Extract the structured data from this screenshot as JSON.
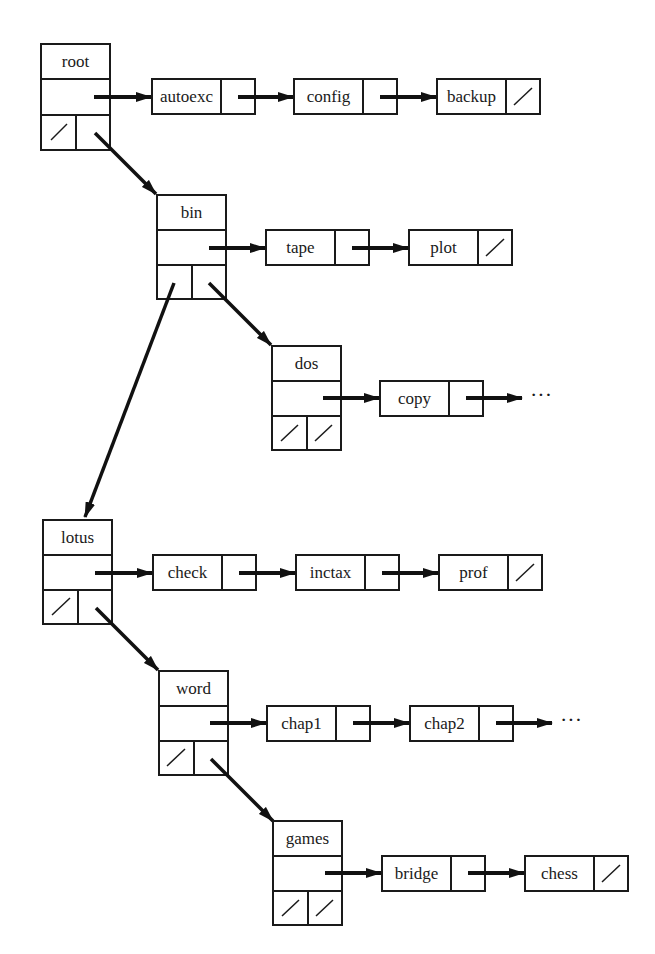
{
  "diagram": {
    "type": "directory-tree-linked-list",
    "colors": {
      "ink": "#1a1a1a",
      "background": "#ffffff"
    },
    "directories": [
      {
        "id": "root",
        "label": "root",
        "files": [
          "autoexc",
          "config",
          "backup"
        ],
        "files_continue": false,
        "left_child": null,
        "right_child": "bin"
      },
      {
        "id": "bin",
        "label": "bin",
        "files": [
          "tape",
          "plot"
        ],
        "files_continue": false,
        "left_child": "lotus",
        "right_child": "dos"
      },
      {
        "id": "dos",
        "label": "dos",
        "files": [
          "copy"
        ],
        "files_continue": true,
        "left_child": null,
        "right_child": null
      },
      {
        "id": "lotus",
        "label": "lotus",
        "files": [
          "check",
          "inctax",
          "prof"
        ],
        "files_continue": false,
        "left_child": null,
        "right_child": "word"
      },
      {
        "id": "word",
        "label": "word",
        "files": [
          "chap1",
          "chap2"
        ],
        "files_continue": true,
        "left_child": null,
        "right_child": "games"
      },
      {
        "id": "games",
        "label": "games",
        "files": [
          "bridge",
          "chess"
        ],
        "files_continue": false,
        "left_child": null,
        "right_child": null
      }
    ],
    "ellipsis": "···"
  },
  "labels": {
    "root": "root",
    "autoexc": "autoexc",
    "config": "config",
    "backup": "backup",
    "bin": "bin",
    "tape": "tape",
    "plot": "plot",
    "dos": "dos",
    "copy": "copy",
    "lotus": "lotus",
    "check": "check",
    "inctax": "inctax",
    "prof": "prof",
    "word": "word",
    "chap1": "chap1",
    "chap2": "chap2",
    "games": "games",
    "bridge": "bridge",
    "chess": "chess",
    "ellipsis": "···"
  }
}
